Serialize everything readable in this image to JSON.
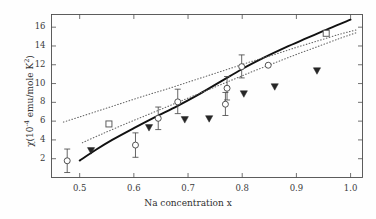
{
  "chart_data": {
    "type": "scatter",
    "title": "",
    "xlabel": "Na concentration x",
    "ylabel": "χ(10⁻⁴ emu/mole K²)",
    "ylabel_parts": {
      "chi": "χ(10",
      "exp": "-4",
      "rest": " emu/mole K",
      "k_exp": "2",
      "close": ")"
    },
    "xlim": [
      0.448,
      1.022
    ],
    "ylim": [
      0.0,
      17.35
    ],
    "xticks": [
      0.5,
      0.6,
      0.7,
      0.8,
      0.9,
      1.0
    ],
    "xticklabels": [
      "0.5",
      "0.6",
      "0.7",
      "0.8",
      "0.9",
      "1.0"
    ],
    "yticks": [
      2,
      4,
      6,
      8,
      10,
      12,
      14,
      16
    ],
    "yticklabels": [
      "2",
      "4",
      "6",
      "8",
      "10",
      "12",
      "14",
      "16"
    ],
    "grid": false,
    "legend": "none",
    "frame": true,
    "series": [
      {
        "name": "open-circle-with-errorbars",
        "marker": "open-circle",
        "color": "#4a4a4a",
        "x": [
          0.477,
          0.603,
          0.645,
          0.681,
          0.769,
          0.772,
          0.799,
          0.848
        ],
        "y": [
          1.78,
          3.45,
          6.3,
          8.05,
          7.8,
          9.5,
          11.8,
          11.95
        ],
        "yerr_low": [
          1.25,
          1.3,
          1.2,
          1.25,
          1.2,
          1.25,
          1.2,
          0.0
        ],
        "yerr_high": [
          1.25,
          1.3,
          1.2,
          1.35,
          1.25,
          1.25,
          1.25,
          0.0
        ]
      },
      {
        "name": "filled-down-triangle",
        "marker": "filled-triangle-down",
        "color": "#262626",
        "x": [
          0.521,
          0.628,
          0.694,
          0.739,
          0.803,
          0.86,
          0.938
        ],
        "y": [
          2.85,
          5.3,
          6.15,
          6.25,
          8.9,
          9.65,
          11.35
        ]
      },
      {
        "name": "open-square",
        "marker": "open-square",
        "color": "#555555",
        "x": [
          0.554,
          0.955
        ],
        "y": [
          5.7,
          15.35
        ]
      }
    ],
    "curves": [
      {
        "name": "solid-theory-curve",
        "style": "solid",
        "color": "#111111",
        "x": [
          0.5,
          0.53,
          0.56,
          0.6,
          0.64,
          0.68,
          0.72,
          0.76,
          0.8,
          0.84,
          0.88,
          0.92,
          0.96,
          1.0
        ],
        "y": [
          1.8,
          2.95,
          4.0,
          5.25,
          6.45,
          7.6,
          8.85,
          10.2,
          11.55,
          12.75,
          13.85,
          14.85,
          15.85,
          16.8
        ]
      },
      {
        "name": "dotted-upper-curve",
        "style": "dotted",
        "color": "#666666",
        "x": [
          0.47,
          0.5,
          0.54,
          0.58,
          0.62,
          0.66,
          0.7,
          0.74,
          0.78,
          0.82,
          0.86,
          0.9,
          0.94,
          0.98,
          1.01
        ],
        "y": [
          5.9,
          6.45,
          7.2,
          7.95,
          8.7,
          9.4,
          10.15,
          10.9,
          11.65,
          12.4,
          13.1,
          13.85,
          14.55,
          15.25,
          15.7
        ]
      },
      {
        "name": "dotted-lower-curve",
        "style": "dotted",
        "color": "#666666",
        "x": [
          0.505,
          0.54,
          0.58,
          0.62,
          0.66,
          0.7,
          0.74,
          0.78,
          0.82,
          0.86,
          0.9,
          0.94,
          0.98,
          1.01
        ],
        "y": [
          3.7,
          4.6,
          5.6,
          6.55,
          7.5,
          8.45,
          9.4,
          10.35,
          11.3,
          12.2,
          13.1,
          13.95,
          14.8,
          15.4
        ]
      }
    ]
  }
}
